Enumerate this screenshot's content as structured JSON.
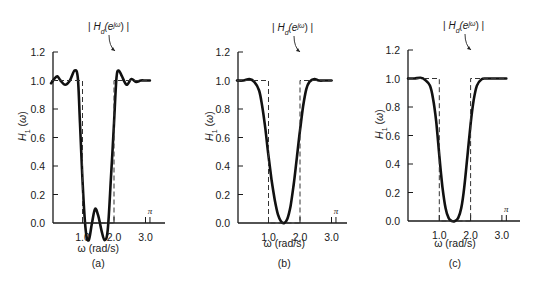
{
  "figure": {
    "panels": [
      {
        "id": "a",
        "label": "(a)"
      },
      {
        "id": "b",
        "label": "(b)"
      },
      {
        "id": "c",
        "label": "(c)"
      }
    ]
  },
  "chart_data": [
    {
      "type": "line",
      "panel_label": "(a)",
      "title": "",
      "xlabel": "ω (rad/s)",
      "ylabel": "H1(ω)",
      "xlim": [
        0,
        3.4
      ],
      "ylim": [
        0,
        1.2
      ],
      "x_ticks": [
        1.0,
        2.0,
        3.0,
        3.14159
      ],
      "x_tick_labels": [
        "1.0",
        "2.0",
        "3.0",
        "π"
      ],
      "y_ticks": [
        0.0,
        0.2,
        0.4,
        0.6,
        0.8,
        1.0,
        1.2
      ],
      "y_tick_labels": [
        "0.0",
        "0.2",
        "0.4",
        "0.6",
        "0.8",
        "1.0",
        "1.2"
      ],
      "annotation": "|Hd(e^jω)|",
      "grid": false,
      "series": [
        {
          "name": "H1(ω)",
          "style": "solid-thick",
          "x": [
            0.0,
            0.1,
            0.2,
            0.3,
            0.45,
            0.6,
            0.75,
            0.85,
            0.92,
            1.0,
            1.1,
            1.2,
            1.3,
            1.4,
            1.5,
            1.6,
            1.7,
            1.8,
            1.9,
            2.0,
            2.08,
            2.15,
            2.25,
            2.4,
            2.55,
            2.7,
            2.85,
            3.0,
            3.14
          ],
          "y": [
            0.98,
            1.01,
            1.03,
            1.0,
            0.97,
            1.0,
            1.07,
            1.02,
            0.7,
            0.3,
            -0.05,
            -0.12,
            0.0,
            0.1,
            0.05,
            -0.05,
            -0.12,
            -0.05,
            0.3,
            0.7,
            1.02,
            1.07,
            1.03,
            0.97,
            1.01,
            0.99,
            1.0,
            1.0,
            1.0
          ]
        },
        {
          "name": "|Hd(e^jω)|",
          "style": "dashed",
          "x": [
            0.0,
            1.0,
            1.0,
            2.0,
            2.0,
            3.14
          ],
          "y": [
            1.0,
            1.0,
            0.0,
            0.0,
            1.0,
            1.0
          ]
        }
      ]
    },
    {
      "type": "line",
      "panel_label": "(b)",
      "title": "",
      "xlabel": "ω (rad/s)",
      "ylabel": "H1(ω)",
      "xlim": [
        0,
        3.4
      ],
      "ylim": [
        0,
        1.2
      ],
      "x_ticks": [
        1.0,
        2.0,
        3.0,
        3.14159
      ],
      "x_tick_labels": [
        "1.0",
        "2.0",
        "3.0",
        "π"
      ],
      "y_ticks": [
        0.0,
        0.2,
        0.4,
        0.6,
        0.8,
        1.0,
        1.2
      ],
      "y_tick_labels": [
        "0.0",
        "0.2",
        "0.4",
        "0.6",
        "0.8",
        "1.0",
        "1.2"
      ],
      "annotation": "|Hd(e^jω)|",
      "grid": false,
      "series": [
        {
          "name": "H1(ω)",
          "style": "solid-thick",
          "x": [
            0.0,
            0.2,
            0.4,
            0.55,
            0.7,
            0.8,
            0.9,
            1.0,
            1.1,
            1.2,
            1.3,
            1.4,
            1.5,
            1.6,
            1.7,
            1.8,
            1.9,
            2.0,
            2.1,
            2.2,
            2.3,
            2.45,
            2.6,
            2.8,
            3.0
          ],
          "y": [
            1.0,
            1.0,
            1.01,
            0.99,
            0.93,
            0.82,
            0.66,
            0.47,
            0.3,
            0.16,
            0.06,
            0.01,
            0.0,
            0.03,
            0.12,
            0.27,
            0.46,
            0.65,
            0.82,
            0.94,
            0.99,
            1.01,
            1.0,
            1.0,
            1.0
          ]
        },
        {
          "name": "|Hd(e^jω)|",
          "style": "dashed",
          "x": [
            0.0,
            1.0,
            1.0,
            2.0,
            2.0,
            3.14
          ],
          "y": [
            1.0,
            1.0,
            0.0,
            0.0,
            1.0,
            1.0
          ]
        }
      ]
    },
    {
      "type": "line",
      "panel_label": "(c)",
      "title": "",
      "xlabel": "ω (rad/s)",
      "ylabel": "H1(ω)",
      "xlim": [
        0,
        3.4
      ],
      "ylim": [
        0,
        1.2
      ],
      "x_ticks": [
        1.0,
        2.0,
        3.0,
        3.14159
      ],
      "x_tick_labels": [
        "1.0",
        "2.0",
        "3.0",
        "π"
      ],
      "y_ticks": [
        0.0,
        0.2,
        0.4,
        0.6,
        0.8,
        1.0,
        1.2
      ],
      "y_tick_labels": [
        "0.0",
        "0.2",
        "0.4",
        "0.6",
        "0.8",
        "1.0",
        "1.2"
      ],
      "annotation": "|Hd(e^jω)|",
      "grid": false,
      "series": [
        {
          "name": "H1(ω)",
          "style": "solid-thick",
          "x": [
            0.0,
            0.2,
            0.4,
            0.55,
            0.7,
            0.8,
            0.9,
            1.0,
            1.1,
            1.2,
            1.3,
            1.4,
            1.5,
            1.6,
            1.7,
            1.8,
            1.9,
            2.0,
            2.1,
            2.2,
            2.35,
            2.5,
            2.7,
            3.0,
            3.14
          ],
          "y": [
            1.0,
            1.0,
            1.005,
            0.99,
            0.95,
            0.86,
            0.7,
            0.46,
            0.24,
            0.09,
            0.02,
            0.0,
            0.0,
            0.02,
            0.09,
            0.24,
            0.46,
            0.68,
            0.85,
            0.95,
            0.995,
            1.0,
            1.0,
            1.0,
            1.0
          ]
        },
        {
          "name": "|Hd(e^jω)|",
          "style": "dashed",
          "x": [
            0.0,
            1.0,
            1.0,
            2.0,
            2.0,
            3.14
          ],
          "y": [
            1.0,
            1.0,
            0.0,
            0.0,
            1.0,
            1.0
          ]
        }
      ]
    }
  ]
}
